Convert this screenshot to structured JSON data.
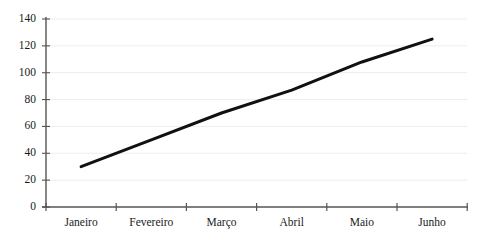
{
  "chart_data": {
    "type": "line",
    "title": "",
    "xlabel": "",
    "ylabel": "",
    "categories": [
      "Janeiro",
      "Fevereiro",
      "Março",
      "Abril",
      "Maio",
      "Junho"
    ],
    "values": [
      30,
      50,
      70,
      87,
      108,
      125
    ],
    "series": [
      {
        "name": "",
        "values": [
          30,
          50,
          70,
          87,
          108,
          125
        ]
      }
    ],
    "ylim": [
      0,
      140
    ],
    "ytick_values": [
      0,
      20,
      40,
      60,
      80,
      100,
      120,
      140
    ],
    "ytick_labels": [
      "0",
      "20",
      "40",
      "60",
      "80",
      "100",
      "120",
      "140"
    ],
    "grid": true,
    "grid_axis": "y",
    "legend": false,
    "legend_position": "none",
    "line_color": "#111111",
    "line_width": 3,
    "markers": false,
    "axis_color": "#555555",
    "grid_color": "#ededed",
    "background_color": "#ffffff",
    "text_color": "#1a1a1a"
  },
  "axes": {
    "y_axis_name": "y-axis",
    "x_axis_name": "x-axis"
  }
}
